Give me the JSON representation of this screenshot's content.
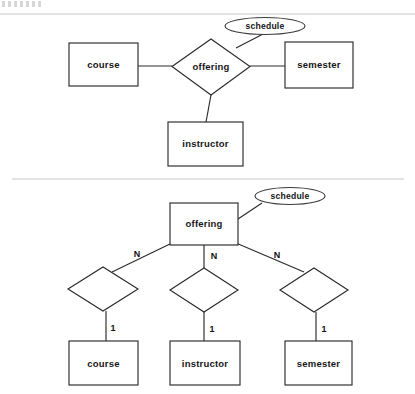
{
  "page": {
    "background_color": "#ffffff",
    "line_color": "#2b2b2b",
    "divider_color": "#c9c9c9"
  },
  "diagram_top": {
    "name": "ternary-relationship-diagram",
    "entities": [
      {
        "id": "course",
        "label": "course",
        "x": 69,
        "y": 43,
        "w": 69,
        "h": 43
      },
      {
        "id": "semester",
        "label": "semester",
        "x": 285,
        "y": 42,
        "w": 68,
        "h": 46
      },
      {
        "id": "instructor",
        "label": "instructor",
        "x": 168,
        "y": 122,
        "w": 75,
        "h": 44
      }
    ],
    "relationship": {
      "id": "offering",
      "label": "offering",
      "cx": 211,
      "cy": 67,
      "rx": 39,
      "ry": 28
    },
    "attribute": {
      "id": "schedule",
      "label": "schedule",
      "cx": 265,
      "cy": 26,
      "rx": 40,
      "ry": 8.5
    },
    "connections": [
      {
        "from": "course",
        "to": "offering"
      },
      {
        "from": "offering",
        "to": "semester"
      },
      {
        "from": "offering",
        "to": "instructor"
      },
      {
        "from": "offering",
        "to": "schedule"
      }
    ]
  },
  "diagram_bottom": {
    "name": "binary-decomposition-diagram",
    "root_entity": {
      "id": "offering",
      "label": "offering",
      "x": 170,
      "y": 203,
      "w": 68,
      "h": 42
    },
    "attribute": {
      "id": "schedule",
      "label": "schedule",
      "cx": 290,
      "cy": 196,
      "rx": 35,
      "ry": 8.5
    },
    "branches": [
      {
        "id": "course-branch",
        "top_cardinality": "N",
        "bottom_cardinality": "1",
        "relationship_diamond": {
          "cx": 103,
          "cy": 289,
          "rx": 35,
          "ry": 22
        },
        "entity": {
          "id": "course",
          "label": "course",
          "x": 69,
          "y": 341,
          "w": 69,
          "h": 44
        }
      },
      {
        "id": "instructor-branch",
        "top_cardinality": "N",
        "bottom_cardinality": "1",
        "relationship_diamond": {
          "cx": 204,
          "cy": 290,
          "rx": 34,
          "ry": 22
        },
        "entity": {
          "id": "instructor",
          "label": "instructor",
          "x": 170,
          "y": 341,
          "w": 70,
          "h": 44
        }
      },
      {
        "id": "semester-branch",
        "top_cardinality": "N",
        "bottom_cardinality": "1",
        "relationship_diamond": {
          "cx": 314,
          "cy": 290,
          "rx": 34,
          "ry": 22
        },
        "entity": {
          "id": "semester",
          "label": "semester",
          "x": 285,
          "y": 341,
          "w": 67,
          "h": 44
        }
      }
    ]
  },
  "dividers": [
    {
      "id": "divider-top",
      "y": 14,
      "x1": 0,
      "x2": 415
    },
    {
      "id": "divider-middle",
      "y": 179,
      "x1": 12,
      "x2": 404
    }
  ],
  "labels": {
    "course": "course",
    "semester": "semester",
    "instructor": "instructor",
    "offering": "offering",
    "schedule": "schedule",
    "many": "N",
    "one": "1"
  }
}
